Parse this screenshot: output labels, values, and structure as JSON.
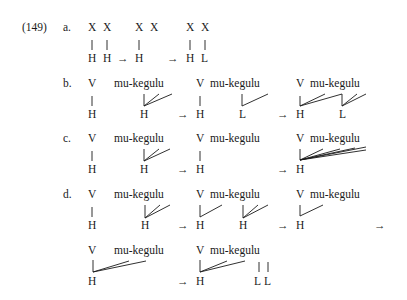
{
  "example": {
    "number": "(149)",
    "arrow": "→",
    "rows": {
      "a": {
        "label": "a.",
        "top": [
          "X",
          "X",
          "X",
          "X",
          "X",
          "X"
        ],
        "bottom": [
          "H",
          "H",
          "H",
          "H",
          "L"
        ]
      },
      "b": {
        "label": "b.",
        "v": "V",
        "word": "mu-kegulu",
        "bottom": [
          "H",
          "H",
          "H",
          "L",
          "H",
          "L"
        ]
      },
      "c": {
        "label": "c.",
        "v": "V",
        "word": "mu-kegulu",
        "bottom": [
          "H",
          "H",
          "H",
          "H"
        ]
      },
      "d": {
        "label": "d.",
        "v": "V",
        "word": "mu-kegulu",
        "bottom": [
          "H",
          "H",
          "H",
          "H",
          "H"
        ]
      },
      "e": {
        "v": "V",
        "word": "mu-kegulu",
        "bottom": [
          "H",
          "H",
          "L",
          "L"
        ]
      }
    }
  }
}
